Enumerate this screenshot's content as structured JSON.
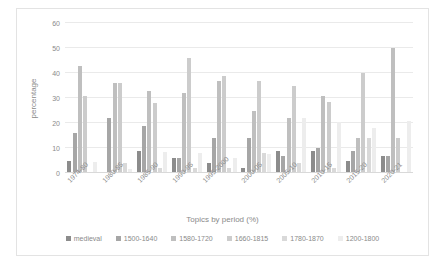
{
  "chart_data": {
    "type": "bar",
    "title": "",
    "xlabel": "Topics by period (%)",
    "ylabel": "percentage",
    "ylim": [
      0,
      60
    ],
    "yticks": [
      0,
      10,
      20,
      30,
      40,
      50,
      60
    ],
    "grid": true,
    "legend_position": "bottom",
    "categories": [
      "1974-80",
      "1980-85",
      "1985-90",
      "1990-95",
      "1995-2000",
      "2000-05",
      "2005-10",
      "2010-15",
      "2015-20",
      "2020-21"
    ],
    "series": [
      {
        "name": "medieval",
        "color": "#8c8c8c",
        "values": [
          5,
          0,
          9,
          6,
          4,
          2,
          9,
          9,
          5,
          7
        ]
      },
      {
        "name": "1500-1640",
        "color": "#a6a6a6",
        "values": [
          16,
          22,
          19,
          6,
          14,
          14,
          7,
          10,
          9,
          7
        ]
      },
      {
        "name": "1580-1720",
        "color": "#bfbfbf",
        "values": [
          43,
          36,
          33,
          32,
          37,
          25,
          22,
          31,
          14,
          50
        ]
      },
      {
        "name": "1660-1815",
        "color": "#cccccc",
        "values": [
          31,
          36,
          28,
          46,
          39,
          37,
          35,
          28.5,
          40,
          14
        ]
      },
      {
        "name": "1780-1870",
        "color": "#d9d9d9",
        "values": [
          0,
          4,
          2,
          2,
          2,
          8,
          4,
          2,
          14,
          0
        ]
      },
      {
        "name": "1200-1800",
        "color": "#ededed",
        "values": [
          4.5,
          1.5,
          8.5,
          8,
          6,
          7.5,
          22,
          20.5,
          18,
          21
        ]
      }
    ]
  }
}
